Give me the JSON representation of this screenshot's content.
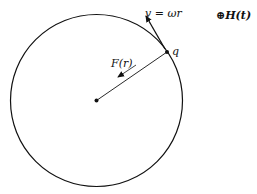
{
  "diagram": {
    "labels": {
      "velocity": "v = ωr",
      "field": "⊕H(t)",
      "charge": "q",
      "force": "F(r)"
    },
    "colors": {
      "stroke": "#111111",
      "background": "#ffffff"
    }
  }
}
